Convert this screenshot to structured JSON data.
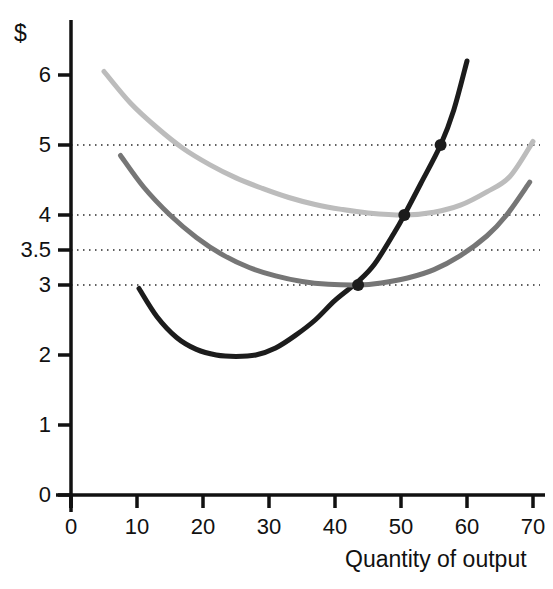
{
  "chart_data": {
    "type": "line",
    "title": "",
    "subtitle": "",
    "xlabel": "Quantity of output",
    "ylabel": "$",
    "xlim": [
      0,
      72
    ],
    "ylim": [
      0,
      6.4
    ],
    "grid": "horizontal-dotted",
    "legend_position": "none",
    "x_ticks": [
      {
        "value": 0,
        "label": "0"
      },
      {
        "value": 10,
        "label": "10"
      },
      {
        "value": 20,
        "label": "20"
      },
      {
        "value": 30,
        "label": "30"
      },
      {
        "value": 40,
        "label": "40"
      },
      {
        "value": 50,
        "label": "50"
      },
      {
        "value": 60,
        "label": "60"
      },
      {
        "value": 70,
        "label": "70"
      }
    ],
    "y_ticks": [
      {
        "value": 0,
        "label": "0"
      },
      {
        "value": 1,
        "label": "1"
      },
      {
        "value": 2,
        "label": "2"
      },
      {
        "value": 3,
        "label": "3"
      },
      {
        "value": 3.5,
        "label": "3.5"
      },
      {
        "value": 4,
        "label": "4"
      },
      {
        "value": 5,
        "label": "5"
      },
      {
        "value": 6,
        "label": "6"
      }
    ],
    "gridlines_y": [
      3,
      3.5,
      4,
      5
    ],
    "series": [
      {
        "name": "marginal-cost",
        "color": "#1c1c1c",
        "width": 5,
        "x": [
          10.3,
          13,
          16,
          19,
          22,
          25,
          28,
          31,
          34,
          37,
          40,
          43.5,
          46,
          49,
          50.5,
          53,
          56,
          58,
          60
        ],
        "values": [
          2.95,
          2.55,
          2.25,
          2.08,
          2.0,
          1.98,
          2.0,
          2.1,
          2.28,
          2.5,
          2.78,
          3.05,
          3.3,
          3.75,
          4.0,
          4.45,
          5.0,
          5.5,
          6.2
        ]
      },
      {
        "name": "average-variable-cost",
        "color": "#767676",
        "width": 5,
        "x": [
          7.5,
          11,
          15,
          19,
          23,
          27,
          31,
          35,
          39,
          43.5,
          47,
          51,
          55,
          59,
          63,
          66,
          69.5
        ],
        "values": [
          4.85,
          4.4,
          4.0,
          3.68,
          3.43,
          3.25,
          3.13,
          3.05,
          3.01,
          3.0,
          3.03,
          3.1,
          3.22,
          3.42,
          3.7,
          4.0,
          4.47
        ]
      },
      {
        "name": "average-total-cost",
        "color": "#bcbcbc",
        "width": 5,
        "x": [
          5,
          9,
          13,
          17,
          21,
          25,
          29,
          33,
          37,
          41,
          45,
          50.5,
          55,
          59,
          63,
          66.5,
          70
        ],
        "values": [
          6.05,
          5.6,
          5.25,
          4.95,
          4.72,
          4.53,
          4.38,
          4.25,
          4.15,
          4.08,
          4.03,
          4.0,
          4.04,
          4.14,
          4.33,
          4.55,
          5.05
        ]
      }
    ],
    "points": [
      {
        "name": "mc-avc-intersection",
        "x": 43.5,
        "y": 3.0,
        "color": "#1c1c1c",
        "r": 6
      },
      {
        "name": "mc-atc-intersection",
        "x": 50.5,
        "y": 4.0,
        "color": "#1c1c1c",
        "r": 6
      },
      {
        "name": "mc-upper-point",
        "x": 56,
        "y": 5.0,
        "color": "#1c1c1c",
        "r": 6
      }
    ]
  }
}
